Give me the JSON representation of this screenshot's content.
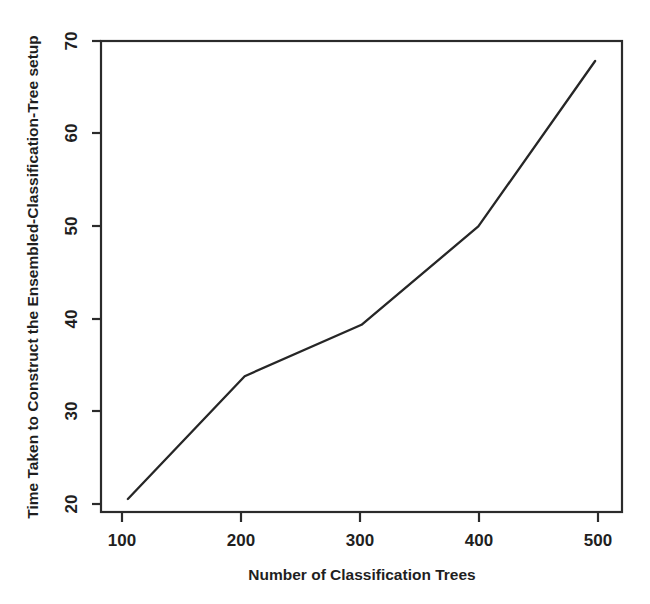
{
  "chart_data": {
    "type": "line",
    "title": "",
    "xlabel": "Number of Classification Trees",
    "ylabel": "Time Taken to Construct the Ensembled-Classification-Tree setup",
    "x": [
      100,
      200,
      300,
      400,
      500
    ],
    "values": [
      18.4,
      32.5,
      38.4,
      49.7,
      68.7
    ],
    "series": [
      {
        "name": "Construction time",
        "values": [
          18.4,
          32.5,
          38.4,
          49.7,
          68.7
        ]
      }
    ],
    "xlim": [
      77,
      523
    ],
    "ylim": [
      16.9,
      71.0
    ],
    "xticks": [
      100,
      200,
      300,
      400,
      500
    ],
    "yticks": [
      20,
      30,
      40,
      50,
      60,
      70
    ],
    "xtick_labels": [
      "100",
      "200",
      "300",
      "400",
      "500"
    ],
    "ytick_labels": [
      "20",
      "30",
      "40",
      "50",
      "60",
      "70"
    ],
    "grid": false,
    "legend": false,
    "legend_position": "none",
    "line_color": "#262626",
    "axis_color": "#2b2b2b",
    "background_color": "#ffffff"
  },
  "axis_titles": {
    "x": "Number of Classification Trees",
    "y": "Time Taken to Construct the Ensembled-Classification-Tree setup"
  },
  "x_tick_labels": [
    "100",
    "200",
    "300",
    "400",
    "500"
  ],
  "y_tick_labels": [
    "20",
    "30",
    "40",
    "50",
    "60",
    "70"
  ]
}
